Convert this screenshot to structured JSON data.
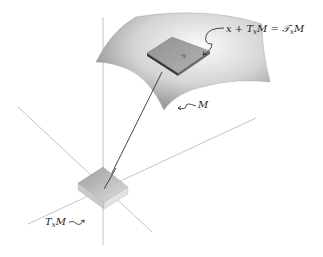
{
  "figure": {
    "type": "3d-manifold-tangent-space-diagram",
    "labels": {
      "point_label": "x",
      "affine_tangent_label": "x + T",
      "affine_tangent_sub": "x",
      "affine_tangent_rest": "M = 𝒯",
      "affine_tangent_sub2": "x",
      "affine_tangent_end": "M",
      "manifold_label": "M",
      "tangent_space_label": "T",
      "tangent_space_sub": "x",
      "tangent_space_rest": "M"
    },
    "colors": {
      "axis": "#b0b0b0",
      "vector": "#333333",
      "surface_light": "#f2f2f2",
      "surface_dark": "#8a8a8a",
      "patch": "#9a9a9a"
    }
  }
}
